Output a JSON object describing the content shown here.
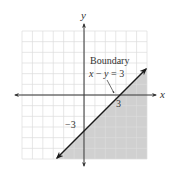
{
  "chart_data": {
    "type": "line",
    "title": "",
    "xlabel": "x",
    "ylabel": "y",
    "xlim": [
      -6,
      6
    ],
    "ylim": [
      -6,
      6
    ],
    "grid": true,
    "series": [
      {
        "name": "Boundary x − y = 3",
        "equation": "x - y = 3",
        "x": [
          -2.7,
          6
        ],
        "y": [
          -5.7,
          3
        ]
      }
    ],
    "shaded_region": "x - y >= 3 (below the boundary line)",
    "annotations": [
      {
        "text": "Boundary",
        "x": 1.2,
        "y": 3.2
      },
      {
        "text": "x − y = 3",
        "x": 1.2,
        "y": 1.9
      },
      {
        "text": "3",
        "x": 3.2,
        "y": -0.6,
        "note": "x-intercept"
      },
      {
        "text": "−3",
        "x": -1.3,
        "y": -2.8,
        "note": "y-intercept"
      }
    ]
  },
  "labels": {
    "x_axis": "x",
    "y_axis": "y",
    "boundary_title": "Boundary",
    "boundary_eq_x": "x",
    "boundary_eq_minus": " − ",
    "boundary_eq_y": "y",
    "boundary_eq_rest": " = 3",
    "x_intercept": "3",
    "y_intercept": "−3"
  },
  "colors": {
    "background": "#ffffff",
    "grid": "#dcdcdc",
    "shade": "#c8c8c8",
    "axis": "#333333",
    "line": "#1a1a1a"
  }
}
